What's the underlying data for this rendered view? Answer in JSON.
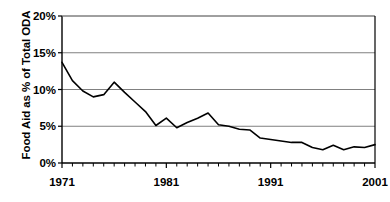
{
  "chart_data": {
    "type": "line",
    "title": "",
    "xlabel": "",
    "ylabel": "Food Aid as % of Total ODA",
    "xlim": [
      1971,
      2001
    ],
    "ylim": [
      0,
      20
    ],
    "grid": true,
    "legend": null,
    "y_ticks": [
      "0%",
      "5%",
      "10%",
      "15%",
      "20%"
    ],
    "y_tick_values": [
      0,
      5,
      10,
      15,
      20
    ],
    "x_ticks": [
      "1971",
      "1981",
      "1991",
      "2001"
    ],
    "x_tick_values": [
      1971,
      1981,
      1991,
      2001
    ],
    "x_minor_tick_step": 1,
    "line_color": "#000000",
    "grid_color": "#808080",
    "axis_color": "#000000",
    "x": [
      1971,
      1972,
      1973,
      1974,
      1975,
      1976,
      1977,
      1978,
      1979,
      1980,
      1981,
      1982,
      1983,
      1984,
      1985,
      1986,
      1987,
      1988,
      1989,
      1990,
      1991,
      1992,
      1993,
      1994,
      1995,
      1996,
      1997,
      1998,
      1999,
      2000,
      2001
    ],
    "values": [
      13.7,
      11.2,
      9.8,
      9.0,
      9.3,
      11.0,
      9.6,
      8.3,
      7.0,
      5.1,
      6.1,
      4.8,
      5.5,
      6.1,
      6.8,
      5.2,
      5.0,
      4.6,
      4.5,
      3.4,
      3.2,
      3.0,
      2.8,
      2.8,
      2.1,
      1.8,
      2.4,
      1.8,
      2.2,
      2.1,
      2.5
    ],
    "series": [
      {
        "name": "Food Aid as % of Total ODA",
        "values": [
          13.7,
          11.2,
          9.8,
          9.0,
          9.3,
          11.0,
          9.6,
          8.3,
          7.0,
          5.1,
          6.1,
          4.8,
          5.5,
          6.1,
          6.8,
          5.2,
          5.0,
          4.6,
          4.5,
          3.4,
          3.2,
          3.0,
          2.8,
          2.8,
          2.1,
          1.8,
          2.4,
          1.8,
          2.2,
          2.1,
          2.5
        ]
      }
    ]
  }
}
